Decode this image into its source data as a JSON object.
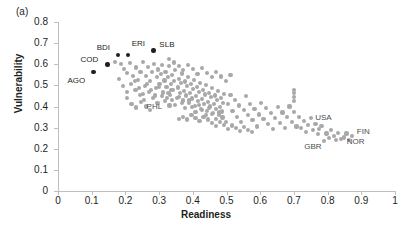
{
  "figure": {
    "panel_label": "(a)"
  },
  "chart_data": {
    "type": "scatter",
    "title": "",
    "xlabel": "Readiness",
    "ylabel": "Vulnerability",
    "xlim": [
      0,
      1
    ],
    "ylim": [
      0,
      0.8
    ],
    "xticks": [
      "0",
      "0.1",
      "0.2",
      "0.3",
      "0.4",
      "0.5",
      "0.6",
      "0.7",
      "0.8",
      "0.9",
      "1"
    ],
    "xtick_values": [
      0,
      0.1,
      0.2,
      0.3,
      0.4,
      0.5,
      0.6,
      0.7,
      0.8,
      0.9,
      1
    ],
    "yticks": [
      "0",
      "0.1",
      "0.2",
      "0.3",
      "0.4",
      "0.5",
      "0.6",
      "0.7",
      "0.8"
    ],
    "ytick_values": [
      0,
      0.1,
      0.2,
      0.3,
      0.4,
      0.5,
      0.6,
      0.7,
      0.8
    ],
    "grid": false,
    "legend": "none",
    "point_color": "#a8a8a8",
    "highlight_color": "#231f20",
    "annotations": [
      {
        "label": "AGO",
        "x": 0.105,
        "y": 0.565,
        "label_dx": -26,
        "label_dy": 9,
        "highlight": true
      },
      {
        "label": "COD",
        "x": 0.147,
        "y": 0.6,
        "label_dx": -27,
        "label_dy": -4,
        "highlight": true
      },
      {
        "label": "BDI",
        "x": 0.177,
        "y": 0.645,
        "label_dx": -21,
        "label_dy": -7,
        "highlight": true
      },
      {
        "label": "ERI",
        "x": 0.207,
        "y": 0.645,
        "label_dx": 4,
        "label_dy": -11,
        "highlight": true
      },
      {
        "label": "SLB",
        "x": 0.283,
        "y": 0.665,
        "label_dx": 6,
        "label_dy": -6,
        "highlight": true
      },
      {
        "label": "PHL",
        "x": 0.331,
        "y": 0.405,
        "label_dx": -23,
        "label_dy": 2,
        "highlight": false
      },
      {
        "label": "USA",
        "x": 0.775,
        "y": 0.292,
        "label_dx": -4,
        "label_dy": -11,
        "highlight": false
      },
      {
        "label": "FIN",
        "x": 0.872,
        "y": 0.262,
        "label_dx": 5,
        "label_dy": -4,
        "highlight": false
      },
      {
        "label": "NOR",
        "x": 0.848,
        "y": 0.253,
        "label_dx": 3,
        "label_dy": 4,
        "highlight": false
      },
      {
        "label": "GBR",
        "x": 0.79,
        "y": 0.235,
        "label_dx": -20,
        "label_dy": 6,
        "highlight": false
      }
    ],
    "points": [
      [
        0.105,
        0.565
      ],
      [
        0.147,
        0.6
      ],
      [
        0.177,
        0.645
      ],
      [
        0.207,
        0.645
      ],
      [
        0.283,
        0.665
      ],
      [
        0.17,
        0.612
      ],
      [
        0.186,
        0.601
      ],
      [
        0.196,
        0.576
      ],
      [
        0.205,
        0.56
      ],
      [
        0.214,
        0.604
      ],
      [
        0.222,
        0.545
      ],
      [
        0.232,
        0.585
      ],
      [
        0.238,
        0.525
      ],
      [
        0.245,
        0.563
      ],
      [
        0.252,
        0.612
      ],
      [
        0.258,
        0.497
      ],
      [
        0.262,
        0.545
      ],
      [
        0.268,
        0.588
      ],
      [
        0.273,
        0.52
      ],
      [
        0.278,
        0.563
      ],
      [
        0.284,
        0.603
      ],
      [
        0.29,
        0.487
      ],
      [
        0.293,
        0.54
      ],
      [
        0.297,
        0.575
      ],
      [
        0.301,
        0.508
      ],
      [
        0.305,
        0.553
      ],
      [
        0.309,
        0.596
      ],
      [
        0.312,
        0.47
      ],
      [
        0.316,
        0.523
      ],
      [
        0.319,
        0.565
      ],
      [
        0.322,
        0.492
      ],
      [
        0.326,
        0.538
      ],
      [
        0.33,
        0.59
      ],
      [
        0.333,
        0.455
      ],
      [
        0.336,
        0.505
      ],
      [
        0.339,
        0.548
      ],
      [
        0.342,
        0.478
      ],
      [
        0.345,
        0.52
      ],
      [
        0.348,
        0.572
      ],
      [
        0.331,
        0.405
      ],
      [
        0.352,
        0.44
      ],
      [
        0.355,
        0.49
      ],
      [
        0.358,
        0.532
      ],
      [
        0.361,
        0.465
      ],
      [
        0.364,
        0.51
      ],
      [
        0.367,
        0.556
      ],
      [
        0.37,
        0.428
      ],
      [
        0.373,
        0.475
      ],
      [
        0.376,
        0.518
      ],
      [
        0.379,
        0.452
      ],
      [
        0.382,
        0.497
      ],
      [
        0.385,
        0.54
      ],
      [
        0.388,
        0.415
      ],
      [
        0.391,
        0.462
      ],
      [
        0.394,
        0.505
      ],
      [
        0.397,
        0.438
      ],
      [
        0.4,
        0.483
      ],
      [
        0.403,
        0.526
      ],
      [
        0.406,
        0.402
      ],
      [
        0.409,
        0.448
      ],
      [
        0.412,
        0.492
      ],
      [
        0.415,
        0.425
      ],
      [
        0.418,
        0.47
      ],
      [
        0.421,
        0.512
      ],
      [
        0.424,
        0.39
      ],
      [
        0.427,
        0.435
      ],
      [
        0.43,
        0.478
      ],
      [
        0.433,
        0.412
      ],
      [
        0.436,
        0.457
      ],
      [
        0.439,
        0.5
      ],
      [
        0.442,
        0.378
      ],
      [
        0.445,
        0.422
      ],
      [
        0.448,
        0.465
      ],
      [
        0.451,
        0.4
      ],
      [
        0.454,
        0.444
      ],
      [
        0.457,
        0.487
      ],
      [
        0.46,
        0.368
      ],
      [
        0.463,
        0.41
      ],
      [
        0.466,
        0.452
      ],
      [
        0.469,
        0.388
      ],
      [
        0.472,
        0.43
      ],
      [
        0.475,
        0.473
      ],
      [
        0.478,
        0.358
      ],
      [
        0.481,
        0.398
      ],
      [
        0.484,
        0.44
      ],
      [
        0.487,
        0.376
      ],
      [
        0.49,
        0.418
      ],
      [
        0.493,
        0.46
      ],
      [
        0.23,
        0.48
      ],
      [
        0.243,
        0.455
      ],
      [
        0.256,
        0.432
      ],
      [
        0.269,
        0.468
      ],
      [
        0.282,
        0.44
      ],
      [
        0.295,
        0.418
      ],
      [
        0.308,
        0.448
      ],
      [
        0.318,
        0.425
      ],
      [
        0.328,
        0.462
      ],
      [
        0.338,
        0.432
      ],
      [
        0.348,
        0.408
      ],
      [
        0.358,
        0.445
      ],
      [
        0.368,
        0.415
      ],
      [
        0.378,
        0.392
      ],
      [
        0.388,
        0.428
      ],
      [
        0.398,
        0.398
      ],
      [
        0.408,
        0.375
      ],
      [
        0.418,
        0.408
      ],
      [
        0.428,
        0.382
      ],
      [
        0.438,
        0.358
      ],
      [
        0.448,
        0.392
      ],
      [
        0.458,
        0.365
      ],
      [
        0.468,
        0.342
      ],
      [
        0.478,
        0.372
      ],
      [
        0.488,
        0.348
      ],
      [
        0.498,
        0.328
      ],
      [
        0.505,
        0.412
      ],
      [
        0.512,
        0.455
      ],
      [
        0.518,
        0.378
      ],
      [
        0.525,
        0.432
      ],
      [
        0.531,
        0.352
      ],
      [
        0.538,
        0.405
      ],
      [
        0.544,
        0.328
      ],
      [
        0.551,
        0.382
      ],
      [
        0.557,
        0.448
      ],
      [
        0.564,
        0.358
      ],
      [
        0.57,
        0.412
      ],
      [
        0.577,
        0.335
      ],
      [
        0.583,
        0.388
      ],
      [
        0.59,
        0.305
      ],
      [
        0.596,
        0.362
      ],
      [
        0.603,
        0.418
      ],
      [
        0.61,
        0.34
      ],
      [
        0.617,
        0.392
      ],
      [
        0.624,
        0.318
      ],
      [
        0.631,
        0.368
      ],
      [
        0.638,
        0.295
      ],
      [
        0.645,
        0.345
      ],
      [
        0.652,
        0.398
      ],
      [
        0.659,
        0.322
      ],
      [
        0.666,
        0.372
      ],
      [
        0.673,
        0.3
      ],
      [
        0.68,
        0.35
      ],
      [
        0.687,
        0.4
      ],
      [
        0.694,
        0.328
      ],
      [
        0.701,
        0.375
      ],
      [
        0.708,
        0.305
      ],
      [
        0.7,
        0.425
      ],
      [
        0.7,
        0.445
      ],
      [
        0.7,
        0.462
      ],
      [
        0.7,
        0.478
      ],
      [
        0.715,
        0.352
      ],
      [
        0.722,
        0.298
      ],
      [
        0.729,
        0.33
      ],
      [
        0.736,
        0.28
      ],
      [
        0.743,
        0.312
      ],
      [
        0.75,
        0.345
      ],
      [
        0.757,
        0.29
      ],
      [
        0.764,
        0.318
      ],
      [
        0.771,
        0.268
      ],
      [
        0.775,
        0.292
      ],
      [
        0.782,
        0.308
      ],
      [
        0.79,
        0.235
      ],
      [
        0.797,
        0.272
      ],
      [
        0.804,
        0.25
      ],
      [
        0.811,
        0.288
      ],
      [
        0.818,
        0.262
      ],
      [
        0.825,
        0.24
      ],
      [
        0.832,
        0.275
      ],
      [
        0.84,
        0.248
      ],
      [
        0.848,
        0.253
      ],
      [
        0.856,
        0.272
      ],
      [
        0.864,
        0.24
      ],
      [
        0.872,
        0.262
      ],
      [
        0.18,
        0.53
      ],
      [
        0.192,
        0.498
      ],
      [
        0.204,
        0.47
      ],
      [
        0.216,
        0.508
      ],
      [
        0.228,
        0.522
      ],
      [
        0.24,
        0.488
      ],
      [
        0.252,
        0.46
      ],
      [
        0.264,
        0.505
      ],
      [
        0.276,
        0.478
      ],
      [
        0.288,
        0.452
      ],
      [
        0.3,
        0.492
      ],
      [
        0.312,
        0.465
      ],
      [
        0.324,
        0.44
      ],
      [
        0.336,
        0.478
      ],
      [
        0.36,
        0.34
      ],
      [
        0.372,
        0.352
      ],
      [
        0.384,
        0.338
      ],
      [
        0.396,
        0.36
      ],
      [
        0.408,
        0.345
      ],
      [
        0.42,
        0.332
      ],
      [
        0.432,
        0.352
      ],
      [
        0.444,
        0.338
      ],
      [
        0.456,
        0.32
      ],
      [
        0.468,
        0.308
      ],
      [
        0.48,
        0.325
      ],
      [
        0.492,
        0.312
      ],
      [
        0.504,
        0.295
      ],
      [
        0.516,
        0.31
      ],
      [
        0.528,
        0.298
      ],
      [
        0.54,
        0.285
      ],
      [
        0.552,
        0.302
      ],
      [
        0.564,
        0.29
      ],
      [
        0.576,
        0.278
      ],
      [
        0.33,
        0.625
      ],
      [
        0.345,
        0.608
      ],
      [
        0.358,
        0.59
      ],
      [
        0.372,
        0.572
      ],
      [
        0.386,
        0.598
      ],
      [
        0.4,
        0.578
      ],
      [
        0.414,
        0.555
      ],
      [
        0.428,
        0.582
      ],
      [
        0.442,
        0.56
      ],
      [
        0.456,
        0.54
      ],
      [
        0.47,
        0.562
      ],
      [
        0.484,
        0.542
      ],
      [
        0.498,
        0.52
      ],
      [
        0.512,
        0.548
      ],
      [
        0.205,
        0.44
      ],
      [
        0.218,
        0.412
      ],
      [
        0.232,
        0.395
      ],
      [
        0.246,
        0.42
      ],
      [
        0.26,
        0.4
      ],
      [
        0.274,
        0.382
      ]
    ]
  }
}
